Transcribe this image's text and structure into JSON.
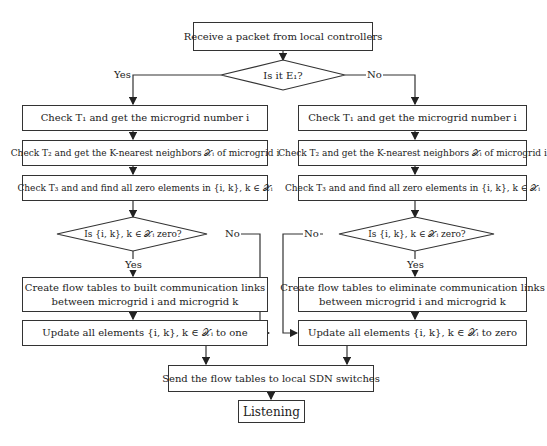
{
  "start": "Receive a packet from local controllers",
  "decision_main": {
    "text": "Is it E₁?",
    "yes": "Yes",
    "no": "No"
  },
  "left": {
    "step1": "Check T₁ and get the microgrid number i",
    "step2": "Check T₂ and get the K-nearest neighbors 𝒳ᵢ of microgrid i",
    "step3": "Check T₃ and and find all zero elements in {i, k}, k ∈ 𝒳ᵢ",
    "decision": {
      "text": "Is {i, k}, k ∈ 𝒳ᵢ zero?",
      "yes": "Yes",
      "no": "No"
    },
    "create_line1": "Create flow tables to built communication links",
    "create_line2": "between microgrid i and microgrid k",
    "update": "Update all elements {i, k}, k ∈ 𝒳ᵢ to one"
  },
  "right": {
    "step1": "Check T₁ and get the microgrid number i",
    "step2": "Check T₂ and get the K-nearest neighbors 𝒳ᵢ of microgrid i",
    "step3": "Check T₃ and and find all zero elements in {i, k}, k ∈ 𝒳ᵢ",
    "decision": {
      "text": "Is {i, k}, k ∈ 𝒳ᵢ zero?",
      "yes": "Yes",
      "no": "No"
    },
    "create_line1": "Create flow tables to eliminate communication links",
    "create_line2": "between microgrid i and microgrid k",
    "update": "Update all elements {i, k}, k ∈ 𝒳ᵢ to zero"
  },
  "send": "Send the flow tables to local SDN switches",
  "end": "Listening"
}
